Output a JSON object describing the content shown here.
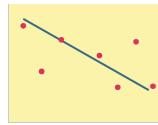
{
  "chart_data": {
    "type": "scatter",
    "title": "",
    "xlabel": "",
    "ylabel": "",
    "grid": false,
    "legend": null,
    "background_color": "#fbf3a9",
    "point_color": "#d9345a",
    "line_color": "#3a6a86",
    "xlim": [
      0,
      10
    ],
    "ylim": [
      0,
      10
    ],
    "points": [
      {
        "x": 0.8,
        "y": 8.6
      },
      {
        "x": 2.1,
        "y": 4.0
      },
      {
        "x": 3.5,
        "y": 7.2
      },
      {
        "x": 6.2,
        "y": 5.6
      },
      {
        "x": 7.5,
        "y": 2.4
      },
      {
        "x": 8.8,
        "y": 7.0
      },
      {
        "x": 10.0,
        "y": 2.5
      }
    ],
    "trend_line": {
      "x1": 0.8,
      "y1": 9.3,
      "x2": 9.7,
      "y2": 2.1
    }
  }
}
